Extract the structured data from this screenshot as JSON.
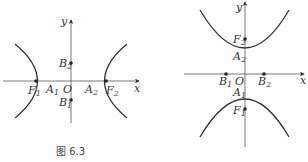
{
  "figure": {
    "caption": "图 6.3",
    "left": {
      "axis_x": "x",
      "axis_y": "y",
      "origin": "O",
      "points": {
        "F1": {
          "name": "F",
          "sub": "1"
        },
        "A1": {
          "name": "A",
          "sub": "1"
        },
        "A2": {
          "name": "A",
          "sub": "2"
        },
        "F2": {
          "name": "F",
          "sub": "2"
        },
        "B1": {
          "name": "B",
          "sub": "1"
        },
        "B2": {
          "name": "B",
          "sub": "2"
        }
      },
      "description": "Hyperbola with foci on x-axis"
    },
    "right": {
      "axis_x": "x",
      "axis_y": "y",
      "origin": "O",
      "points": {
        "F1": {
          "name": "F",
          "sub": "1"
        },
        "A1": {
          "name": "A",
          "sub": "1"
        },
        "A2": {
          "name": "A",
          "sub": "2"
        },
        "F2": {
          "name": "F",
          "sub": "2"
        },
        "B1": {
          "name": "B",
          "sub": "1"
        },
        "B2": {
          "name": "B",
          "sub": "2"
        }
      },
      "description": "Hyperbola with foci on y-axis"
    },
    "colors": {
      "ink": "#333333",
      "background": "#ffffff"
    }
  }
}
